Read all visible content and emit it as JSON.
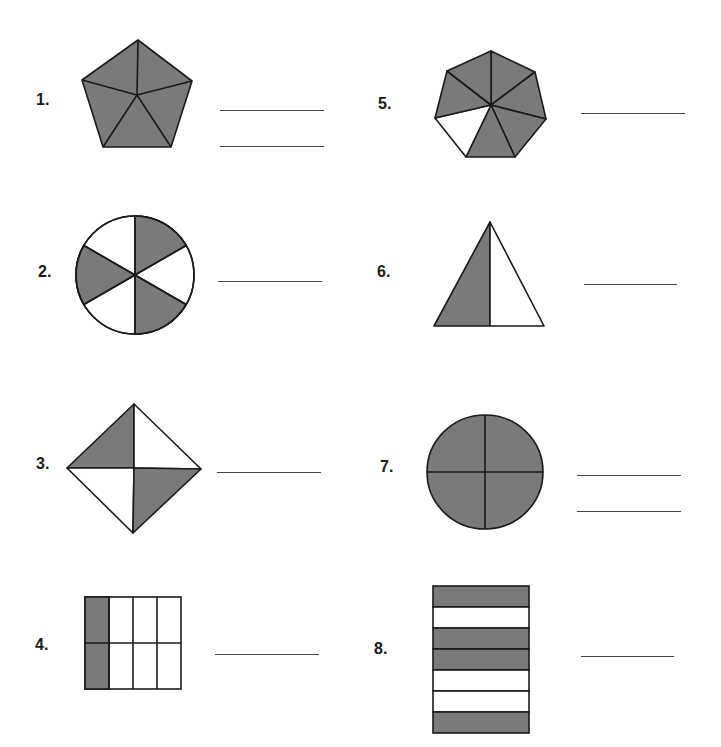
{
  "worksheet": {
    "fill_color": "#7a7a7a",
    "stroke_color": "#1a1a1a",
    "problems": [
      {
        "number": "1.",
        "shape": "pentagon",
        "parts": 5,
        "shaded": 5,
        "answer_lines": 2
      },
      {
        "number": "2.",
        "shape": "circle",
        "parts": 6,
        "shaded": 3,
        "answer_lines": 1
      },
      {
        "number": "3.",
        "shape": "diamond",
        "parts": 4,
        "shaded": 2,
        "answer_lines": 1
      },
      {
        "number": "4.",
        "shape": "rectangle-grid",
        "parts": 8,
        "shaded": 2,
        "answer_lines": 1
      },
      {
        "number": "5.",
        "shape": "heptagon",
        "parts": 7,
        "shaded": 6,
        "answer_lines": 1
      },
      {
        "number": "6.",
        "shape": "triangle",
        "parts": 2,
        "shaded": 1,
        "answer_lines": 1
      },
      {
        "number": "7.",
        "shape": "circle",
        "parts": 4,
        "shaded": 4,
        "answer_lines": 2
      },
      {
        "number": "8.",
        "shape": "rectangle-strips",
        "parts": 7,
        "shaded": 4,
        "answer_lines": 1
      }
    ]
  }
}
